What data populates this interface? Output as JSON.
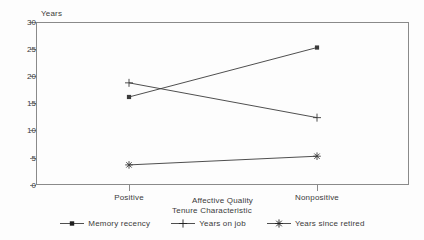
{
  "chart_data": {
    "type": "line",
    "title": "",
    "xlabel": "Affective Quality",
    "ylabel": "Years",
    "categories": [
      "Positive",
      "Nonpositive"
    ],
    "ylim": [
      0,
      30
    ],
    "yticks": [
      0,
      5,
      10,
      15,
      20,
      25,
      30
    ],
    "ytick_labels": [
      "0",
      "5",
      "10",
      "15",
      "20",
      "25",
      "30"
    ],
    "grid": false,
    "legend_position": "bottom",
    "legend_title": "Tenure Characteristic",
    "series": [
      {
        "name": "Memory recency",
        "values": [
          16.2,
          25.3
        ],
        "marker": "square",
        "color": "#3b3b3b"
      },
      {
        "name": "Years on job",
        "values": [
          18.8,
          12.4
        ],
        "marker": "plus",
        "color": "#3b3b3b"
      },
      {
        "name": "Years since retired",
        "values": [
          3.7,
          5.3
        ],
        "marker": "asterisk",
        "color": "#3b3b3b"
      }
    ]
  },
  "axes": {
    "y_title": "Years",
    "x_title": "Affective Quality",
    "y_ticks": [
      {
        "label": "30",
        "value": 30
      },
      {
        "label": "25",
        "value": 25
      },
      {
        "label": "20",
        "value": 20
      },
      {
        "label": "15",
        "value": 15
      },
      {
        "label": "10",
        "value": 10
      },
      {
        "label": "5",
        "value": 5
      },
      {
        "label": "0",
        "value": 0
      }
    ],
    "x_ticks": [
      {
        "label": "Positive"
      },
      {
        "label": "Nonpositive"
      }
    ]
  },
  "legend": {
    "title": "Tenure Characteristic",
    "items": [
      {
        "label": "Memory recency",
        "marker": "square-marker"
      },
      {
        "label": "Years on job",
        "marker": "plus-marker"
      },
      {
        "label": "Years since retired",
        "marker": "asterisk-marker"
      }
    ]
  },
  "colors": {
    "line": "#3b3b3b",
    "axis": "#8a8a8a",
    "text": "#3b3b3b",
    "background": "#fdfdfd"
  }
}
